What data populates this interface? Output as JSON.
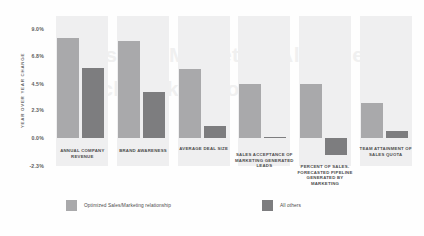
{
  "chart_data": {
    "type": "bar",
    "title": "",
    "xlabel": "",
    "ylabel": "YEAR OVER YEAR CHANGE",
    "ylim": [
      -2.3,
      10.1
    ],
    "grid": false,
    "legend_position": "bottom",
    "ytick_labels": [
      "9.0%",
      "6.8%",
      "4.5%",
      "2.3%",
      "0.0%",
      "-2.3%"
    ],
    "ytick_values": [
      9.0,
      6.8,
      4.5,
      2.3,
      0.0,
      -2.3
    ],
    "categories": [
      "ANNUAL COMPANY REVENUE",
      "BRAND AWARENESS",
      "AVERAGE DEAL SIZE",
      "SALES ACCEPTANCE OF MARKETING GENERATED LEADS",
      "PERCENT OF SALES-FORECASTED PIPELINE GENERATED BY MARKETING",
      "TEAM ATTAINMENT OF SALES QUOTA"
    ],
    "series": [
      {
        "name": "Optimized Sales/Marketing relationship",
        "color": "#a9a9ab",
        "values": [
          8.3,
          8.0,
          5.7,
          4.5,
          4.5,
          2.9
        ]
      },
      {
        "name": "All others",
        "color": "#7d7d7f",
        "values": [
          5.8,
          3.8,
          1.0,
          0.1,
          -1.4,
          0.6
        ]
      }
    ]
  },
  "watermark": {
    "line1": "Sales and Marketing Alignment",
    "line2": "Benchmark Report"
  },
  "legend": {
    "items": [
      {
        "label": "Optimized Sales/Marketing relationship",
        "color": "#a9a9ab"
      },
      {
        "label": "All others",
        "color": "#7d7d7f"
      }
    ]
  },
  "colors": {
    "band": "#efeff0",
    "series_light": "#a9a9ab",
    "series_dark": "#7d7d7f",
    "text": "#4d4d4d",
    "background": "#fefefe"
  }
}
